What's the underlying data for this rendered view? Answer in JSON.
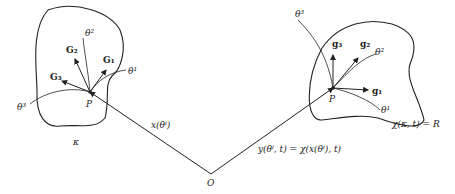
{
  "diagram": {
    "reference_body": {
      "label": "κ",
      "point": "P",
      "base_vectors": [
        "G₁",
        "G₂",
        "G₃"
      ],
      "curves": [
        "θ¹",
        "θ²",
        "θ³"
      ]
    },
    "current_body": {
      "label": "χ(κ, t) = R",
      "point": "P",
      "base_vectors": [
        "𝐠₁",
        "𝐠₂",
        "𝐠₃"
      ],
      "curves": [
        "θ¹",
        "θ²",
        "θ³"
      ]
    },
    "origin": "O",
    "position_reference": "x(θⁱ)",
    "position_current": "y(θⁱ, t) = χ(x(θⁱ), t)"
  }
}
